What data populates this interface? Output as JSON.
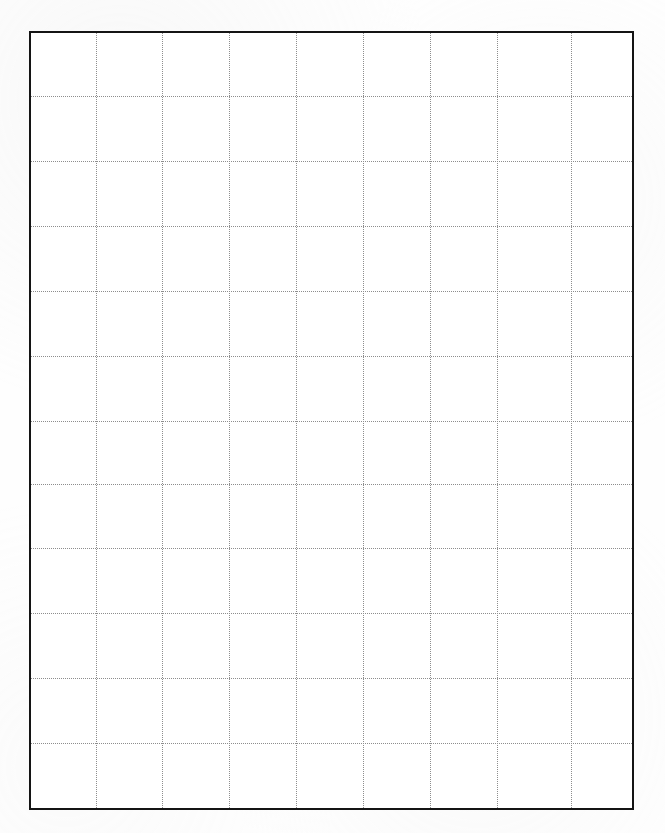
{
  "document": {
    "kind": "blank-grid-sheet",
    "title": "Blank Grid Sheet",
    "background_color": "#fefefe",
    "page_width": 665,
    "page_height": 833,
    "has_text": false,
    "has_labels": false,
    "has_legend": false
  },
  "frame": {
    "name": "grid-border",
    "left": 29,
    "top": 31,
    "width": 605,
    "height": 779,
    "border_width": 2,
    "border_style": "solid",
    "border_color": "#141414",
    "fill_color": "#ffffff"
  },
  "grid": {
    "line_color": "#8d8d8d",
    "line_style": "dotted",
    "line_width": 1,
    "columns": 9,
    "rows": 12,
    "column_spacing": 67,
    "row_spacing": 65,
    "vertical_line_count": 8,
    "horizontal_line_count": 11,
    "vertical_positions": [
      65,
      131,
      198,
      265,
      332,
      399,
      466,
      540
    ],
    "horizontal_positions": [
      63,
      128,
      193,
      258,
      323,
      388,
      451,
      515,
      580,
      645,
      710
    ]
  },
  "chart_data": {
    "type": "table",
    "title": "",
    "xlabel": "",
    "ylabel": "",
    "grid": true,
    "legend": false,
    "categories": [],
    "values": [],
    "series": [],
    "note": "Empty graph-paper grid: 9 columns by 12 rows of dotted cells inside a solid black rectangular border. No data is plotted, no axis ticks, no tick labels, no annotations."
  }
}
